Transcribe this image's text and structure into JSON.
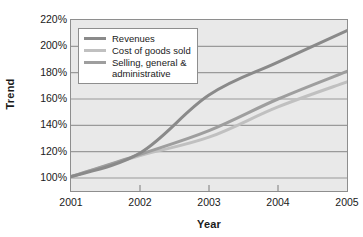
{
  "chart_data": {
    "type": "line",
    "title": "",
    "xlabel": "Year",
    "ylabel": "Trend",
    "x": [
      "2001",
      "2002",
      "2003",
      "2004",
      "2005"
    ],
    "ylim": [
      100,
      220
    ],
    "ytick_labels": [
      "100%",
      "120%",
      "140%",
      "160%",
      "180%",
      "200%",
      "220%"
    ],
    "ytick_values": [
      100,
      120,
      140,
      160,
      180,
      200,
      220
    ],
    "grid": "horizontal",
    "legend_position": "top-left-inside",
    "series": [
      {
        "name": "Revenues",
        "color": "#8a8a8a",
        "values": [
          101,
          119,
          163,
          188,
          212
        ]
      },
      {
        "name": "Cost of goods sold",
        "color": "#c0c0c0",
        "values": [
          101,
          117,
          131,
          154,
          173
        ]
      },
      {
        "name": "Selling, general &\nadministrative",
        "color": "#9e9e9e",
        "values": [
          101,
          118,
          136,
          160,
          181
        ]
      }
    ]
  },
  "axes": {
    "y_title": "Trend",
    "x_title": "Year",
    "y_ticks": [
      {
        "label": "220%"
      },
      {
        "label": "200%"
      },
      {
        "label": "180%"
      },
      {
        "label": "160%"
      },
      {
        "label": "140%"
      },
      {
        "label": "120%"
      },
      {
        "label": "100%"
      }
    ],
    "x_ticks": [
      {
        "label": "2001"
      },
      {
        "label": "2002"
      },
      {
        "label": "2003"
      },
      {
        "label": "2004"
      },
      {
        "label": "2005"
      }
    ]
  },
  "legend": {
    "items": [
      {
        "label": "Revenues"
      },
      {
        "label": "Cost of goods sold"
      },
      {
        "label": "Selling, general &\nadministrative"
      }
    ]
  },
  "colors": {
    "plot_background": "#e9e9e9",
    "frame": "#8e8e8e",
    "gridline": "#9a9a9a",
    "text": "#1a1a1a",
    "revenues": "#8a8a8a",
    "cogs": "#c0c0c0",
    "sga": "#9e9e9e"
  }
}
